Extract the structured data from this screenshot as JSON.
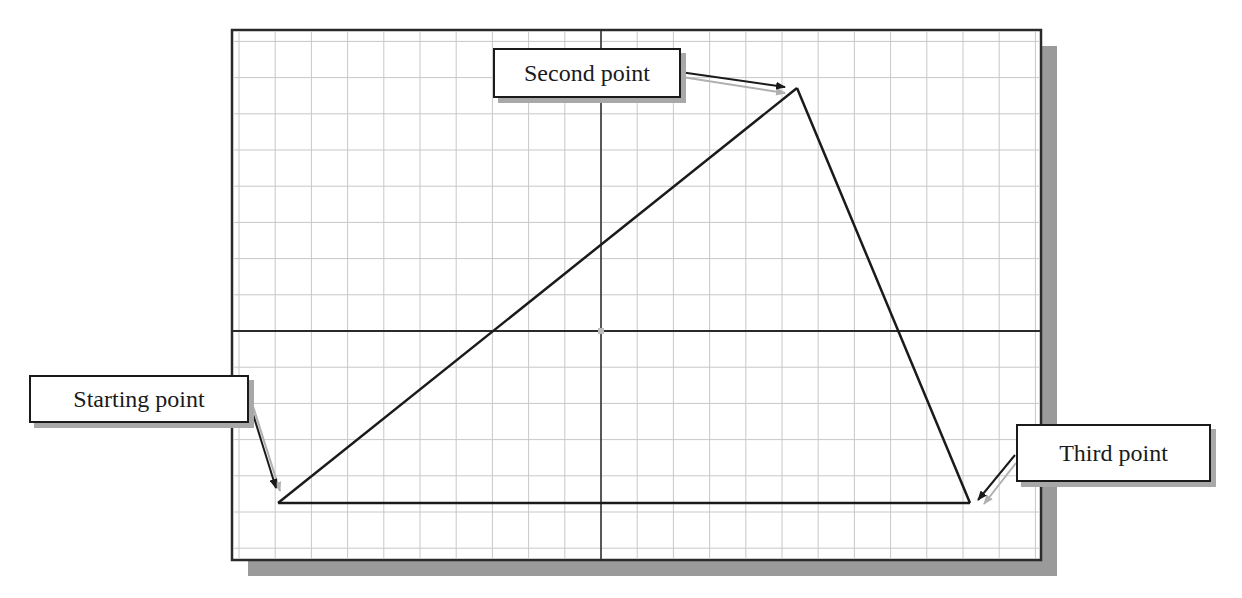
{
  "diagram": {
    "type": "grid-drawing-triangle",
    "frame": {
      "x": 232,
      "y": 30,
      "width": 809,
      "height": 530
    },
    "grid": {
      "spacing": 36.2,
      "origin": {
        "x": 601,
        "y": 331
      },
      "color": "#c8c8c8"
    },
    "axes_color": "#2a2a2a",
    "line_color": "#1a1a1a",
    "shadow_color": "#9a9a9a",
    "points": {
      "start": {
        "x": 278,
        "y": 503
      },
      "second": {
        "x": 797,
        "y": 88
      },
      "third": {
        "x": 970,
        "y": 503
      }
    }
  },
  "callouts": {
    "starting_point": {
      "label": "Starting point"
    },
    "second_point": {
      "label": "Second point"
    },
    "third_point": {
      "label": "Third point"
    }
  }
}
